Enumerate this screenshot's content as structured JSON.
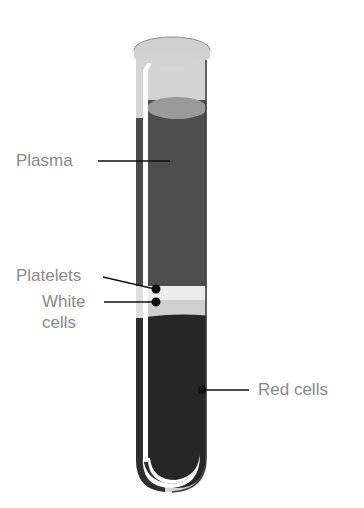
{
  "labels": {
    "plasma": "Plasma",
    "platelets": "Platelets",
    "white_cells_line1": "White",
    "white_cells_line2": "cells",
    "red_cells": "Red cells"
  },
  "colors": {
    "plasma": "#4e4e4e",
    "plasma_top": "#9a9a9a",
    "platelets": "#e9e9e9",
    "white_cells": "#cfcfcf",
    "red_cells": "#2a2a2a",
    "glass": "#c8c8c8",
    "label_text": "#8a8a8a",
    "leader_line": "#111111"
  }
}
